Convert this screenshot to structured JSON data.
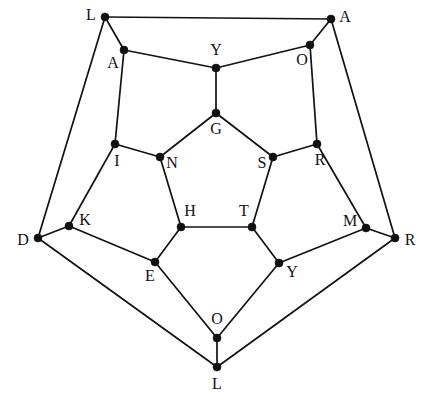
{
  "figure": {
    "kind": "dodecahedron-schlegel-graph",
    "background_color": "#ffffff",
    "edge_color": "#111111",
    "vertex_color": "#111111",
    "label_color": "#111111",
    "vertex_radius": 4,
    "edge_width": 1.7,
    "width": 428,
    "height": 402
  },
  "chart_data": {
    "type": "graph",
    "title": "",
    "node_count": 20,
    "edge_count": 30,
    "nodes": [
      {
        "id": "n1",
        "label": "L",
        "x": 105,
        "y": 17,
        "lx": 91,
        "ly": 16,
        "ring": "outer"
      },
      {
        "id": "n2",
        "label": "A",
        "x": 331,
        "y": 19,
        "lx": 345,
        "ly": 18,
        "ring": "outer"
      },
      {
        "id": "n3",
        "label": "R",
        "x": 395,
        "y": 238,
        "lx": 410,
        "ly": 241,
        "ring": "outer"
      },
      {
        "id": "n4",
        "label": "L",
        "x": 217,
        "y": 367,
        "lx": 217,
        "ly": 385,
        "ring": "outer"
      },
      {
        "id": "n5",
        "label": "D",
        "x": 38,
        "y": 238,
        "lx": 23,
        "ly": 241,
        "ring": "outer"
      },
      {
        "id": "n6",
        "label": "A",
        "x": 124,
        "y": 50,
        "lx": 113,
        "ly": 64,
        "ring": "middle-upper"
      },
      {
        "id": "n7",
        "label": "O",
        "x": 310,
        "y": 45,
        "lx": 302,
        "ly": 61,
        "ring": "middle-upper"
      },
      {
        "id": "n8",
        "label": "M",
        "x": 366,
        "y": 228,
        "lx": 350,
        "ly": 222,
        "ring": "middle-upper"
      },
      {
        "id": "n9",
        "label": "O",
        "x": 217,
        "y": 338,
        "lx": 217,
        "ly": 320,
        "ring": "middle-upper"
      },
      {
        "id": "n10",
        "label": "K",
        "x": 69,
        "y": 226,
        "lx": 85,
        "ly": 221,
        "ring": "middle-upper"
      },
      {
        "id": "n11",
        "label": "Y",
        "x": 216,
        "y": 68,
        "lx": 216,
        "ly": 51,
        "ring": "middle-lower"
      },
      {
        "id": "n12",
        "label": "R",
        "x": 317,
        "y": 144,
        "lx": 320,
        "ly": 161,
        "ring": "middle-lower"
      },
      {
        "id": "n13",
        "label": "Y",
        "x": 279,
        "y": 263,
        "lx": 292,
        "ly": 273,
        "ring": "middle-lower"
      },
      {
        "id": "n14",
        "label": "E",
        "x": 155,
        "y": 262,
        "lx": 150,
        "ly": 277,
        "ring": "middle-lower"
      },
      {
        "id": "n15",
        "label": "I",
        "x": 115,
        "y": 144,
        "lx": 117,
        "ly": 162,
        "ring": "middle-lower"
      },
      {
        "id": "n16",
        "label": "G",
        "x": 216,
        "y": 113,
        "lx": 216,
        "ly": 130,
        "ring": "inner"
      },
      {
        "id": "n17",
        "label": "S",
        "x": 273,
        "y": 157,
        "lx": 262,
        "ly": 164,
        "ring": "inner"
      },
      {
        "id": "n18",
        "label": "T",
        "x": 252,
        "y": 227,
        "lx": 244,
        "ly": 212,
        "ring": "inner"
      },
      {
        "id": "n19",
        "label": "H",
        "x": 181,
        "y": 227,
        "lx": 190,
        "ly": 212,
        "ring": "inner"
      },
      {
        "id": "n20",
        "label": "N",
        "x": 160,
        "y": 157,
        "lx": 172,
        "ly": 164,
        "ring": "inner"
      }
    ],
    "edges": [
      [
        "n1",
        "n2"
      ],
      [
        "n2",
        "n3"
      ],
      [
        "n3",
        "n4"
      ],
      [
        "n4",
        "n5"
      ],
      [
        "n5",
        "n1"
      ],
      [
        "n1",
        "n6"
      ],
      [
        "n2",
        "n7"
      ],
      [
        "n3",
        "n8"
      ],
      [
        "n4",
        "n9"
      ],
      [
        "n5",
        "n10"
      ],
      [
        "n6",
        "n11"
      ],
      [
        "n11",
        "n7"
      ],
      [
        "n7",
        "n12"
      ],
      [
        "n12",
        "n8"
      ],
      [
        "n8",
        "n13"
      ],
      [
        "n13",
        "n9"
      ],
      [
        "n9",
        "n14"
      ],
      [
        "n14",
        "n10"
      ],
      [
        "n10",
        "n15"
      ],
      [
        "n15",
        "n6"
      ],
      [
        "n11",
        "n16"
      ],
      [
        "n12",
        "n17"
      ],
      [
        "n13",
        "n18"
      ],
      [
        "n14",
        "n19"
      ],
      [
        "n15",
        "n20"
      ],
      [
        "n16",
        "n17"
      ],
      [
        "n17",
        "n18"
      ],
      [
        "n18",
        "n19"
      ],
      [
        "n19",
        "n20"
      ],
      [
        "n20",
        "n16"
      ]
    ],
    "outer_ring_labels": [
      "L",
      "A",
      "R",
      "L",
      "D"
    ],
    "middle_upper_ring_labels": [
      "A",
      "O",
      "M",
      "O",
      "K"
    ],
    "middle_lower_ring_labels": [
      "Y",
      "R",
      "Y",
      "E",
      "I"
    ],
    "inner_ring_labels": [
      "G",
      "S",
      "T",
      "H",
      "N"
    ],
    "all_labels": [
      "L",
      "A",
      "R",
      "L",
      "D",
      "A",
      "O",
      "M",
      "O",
      "K",
      "Y",
      "R",
      "Y",
      "E",
      "I",
      "G",
      "S",
      "T",
      "H",
      "N"
    ]
  }
}
